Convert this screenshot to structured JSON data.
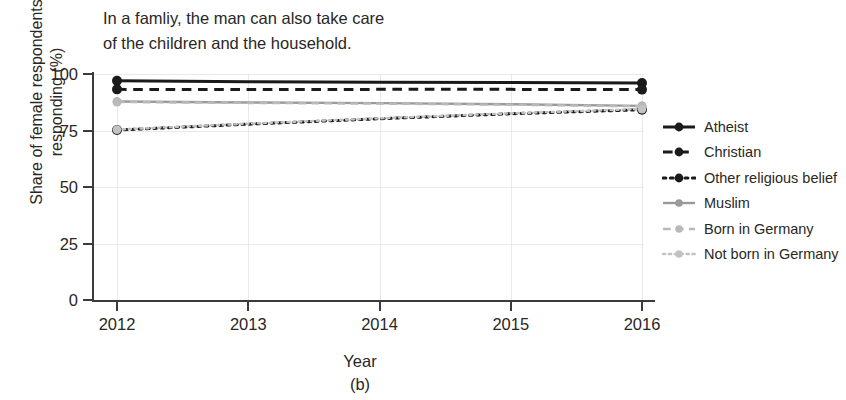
{
  "chart_data": {
    "type": "line",
    "title": "In a famliy, the man can also take care\nof the children and the household.",
    "xlabel": "Year",
    "ylabel": "Share of female respondents\nresponding (%)",
    "subcaption": "(b)",
    "x": [
      2012,
      2013,
      2014,
      2015,
      2016
    ],
    "xtick_labels": [
      "2012",
      "2013",
      "2014",
      "2015",
      "2016"
    ],
    "ytick_labels": [
      "0",
      "25",
      "50",
      "75",
      "100"
    ],
    "yticks": [
      0,
      25,
      50,
      75,
      100
    ],
    "ylim": [
      0,
      100
    ],
    "xlim": [
      2012,
      2016
    ],
    "grid": true,
    "legend_position": "right",
    "series": [
      {
        "name": "Atheist",
        "values": [
          97,
          96.6,
          96.4,
          96.2,
          96
        ],
        "color": "#1a1a1a",
        "style": "solid",
        "marker": "circle"
      },
      {
        "name": "Christian",
        "values": [
          93.2,
          93.1,
          93.2,
          93.2,
          93.1
        ],
        "color": "#1a1a1a",
        "style": "dashed",
        "marker": "circle"
      },
      {
        "name": "Other religious belief",
        "values": [
          75.2,
          77.8,
          80.2,
          82.4,
          84.2
        ],
        "color": "#1a1a1a",
        "style": "dotted",
        "marker": "circle"
      },
      {
        "name": "Muslim",
        "values": [
          87.8,
          87.4,
          87.1,
          86.6,
          85.9
        ],
        "color": "#9a9a9a",
        "style": "solid",
        "marker": "circle"
      },
      {
        "name": "Born in Germany",
        "values": [
          87.6,
          87.2,
          86.9,
          86.4,
          85.7
        ],
        "color": "#b9b9b9",
        "style": "dashed",
        "marker": "circle"
      },
      {
        "name": "Not born in Germany",
        "values": [
          75.4,
          78.0,
          80.4,
          82.6,
          84.5
        ],
        "color": "#c2c2c2",
        "style": "dotted",
        "marker": "circle"
      }
    ]
  }
}
